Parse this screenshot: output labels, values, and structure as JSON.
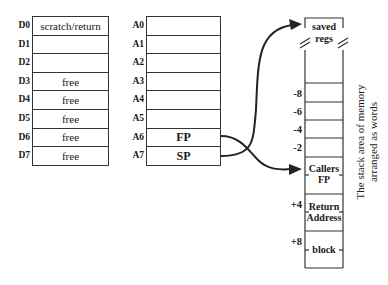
{
  "data_registers": {
    "labels": [
      "D0",
      "D1",
      "D2",
      "D3",
      "D4",
      "D5",
      "D6",
      "D7"
    ],
    "values": [
      "scratch/return",
      "",
      "",
      "free",
      "free",
      "free",
      "free",
      "free"
    ]
  },
  "address_registers": {
    "labels": [
      "A0",
      "A1",
      "A2",
      "A3",
      "A4",
      "A5",
      "A6",
      "A7"
    ],
    "values": [
      "",
      "",
      "",
      "",
      "",
      "",
      "FP",
      "SP"
    ]
  },
  "stack": {
    "top_label_line1": "saved",
    "top_label_line2": "regs",
    "offsets": [
      "-8",
      "-6",
      "-4",
      "-2",
      "+4",
      "+8"
    ],
    "callers_fp_line1": "Callers",
    "callers_fp_line2": "FP",
    "return_address_line1": "Return",
    "return_address_line2": "Address",
    "block_label": "block",
    "caption_line1": "The stack area of memory",
    "caption_line2": "arranged as words"
  },
  "arrows": [
    {
      "from": "A6 (FP)",
      "to": "Callers FP"
    },
    {
      "from": "A7 (SP)",
      "to": "saved regs"
    }
  ],
  "colors": {
    "line": "#333333",
    "text": "#1a1a1a",
    "background": "#ffffff"
  }
}
